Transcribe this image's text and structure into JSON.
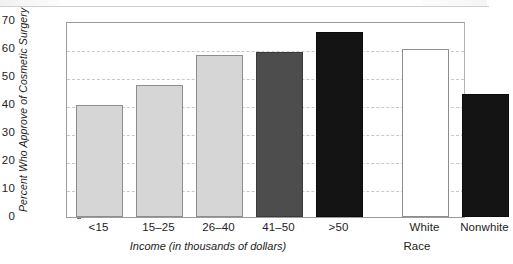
{
  "chart_data": {
    "type": "bar",
    "title": "",
    "subtitle": "",
    "xlabel": "Income (in thousands of dollars)",
    "xlabel_secondary": "Race",
    "ylabel": "Percent Who Approve of Cosmetic Surgery",
    "ylim": [
      0,
      70
    ],
    "ytick_step": 10,
    "yticks": [
      "70",
      "60",
      "50",
      "40",
      "30",
      "20",
      "10",
      "0"
    ],
    "grid": true,
    "grid_style": "dashed-horizontal",
    "legend": "none",
    "categories": [
      "<15",
      "15–25",
      "26–40",
      "41–50",
      ">50",
      "White",
      "Nonwhite"
    ],
    "values": [
      40,
      47,
      58,
      59,
      66,
      60,
      44
    ],
    "groups": [
      {
        "name": "Income (in thousands of dollars)",
        "categories": [
          "<15",
          "15–25",
          "26–40",
          "41–50",
          ">50"
        ],
        "values": [
          40,
          47,
          58,
          59,
          66
        ]
      },
      {
        "name": "Race",
        "categories": [
          "White",
          "Nonwhite"
        ],
        "values": [
          60,
          44
        ]
      }
    ],
    "bar_styles": [
      "light",
      "light",
      "light",
      "mid",
      "dark",
      "open",
      "dark"
    ],
    "colors": {
      "light": "#d6d6d6",
      "mid": "#4d4d4d",
      "dark": "#141414",
      "open": "#ffffff",
      "bar_outline": "#8d8d8d",
      "axis": "#9b9b9b",
      "gridline": "#c9c9c9",
      "text": "#1d1d1d"
    }
  },
  "axis": {
    "y": {
      "label": "Percent Who Approve of Cosmetic Surgery",
      "ticks": [
        {
          "value": "70"
        },
        {
          "value": "60"
        },
        {
          "value": "50"
        },
        {
          "value": "40"
        },
        {
          "value": "30"
        },
        {
          "value": "20"
        },
        {
          "value": "10"
        },
        {
          "value": "0"
        }
      ]
    },
    "x": {
      "label_income": "Income (in thousands of dollars)",
      "label_race": "Race",
      "ticks": [
        {
          "label": "<15"
        },
        {
          "label": "15–25"
        },
        {
          "label": "26–40"
        },
        {
          "label": "41–50"
        },
        {
          "label": ">50"
        },
        {
          "label": "White"
        },
        {
          "label": "Nonwhite"
        }
      ]
    }
  }
}
